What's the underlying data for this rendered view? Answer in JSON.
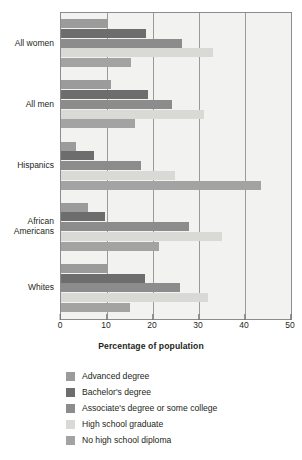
{
  "chart_data": {
    "type": "bar",
    "orientation": "horizontal",
    "title": "",
    "xlabel": "Percentage of population",
    "ylabel": "",
    "xlim": [
      0,
      50
    ],
    "xticks": [
      0,
      10,
      20,
      30,
      40,
      50
    ],
    "xtick_labels": [
      "0",
      "10",
      "20",
      "30",
      "40",
      "50"
    ],
    "grid": true,
    "grid_axis": "x",
    "legend_position": "bottom",
    "categories": [
      "All women",
      "All men",
      "Hispanics",
      "African\nAmericans",
      "Whites"
    ],
    "series": [
      {
        "name": "Advanced degree",
        "color": "#9b9b9b",
        "values": [
          10.0,
          10.9,
          3.3,
          5.8,
          10.0
        ]
      },
      {
        "name": "Bachelor's degree",
        "color": "#6d6d6d",
        "values": [
          18.5,
          19.0,
          7.2,
          9.6,
          18.2
        ]
      },
      {
        "name": "Associate's degree or some college",
        "color": "#8c8c8c",
        "values": [
          26.3,
          24.2,
          17.4,
          27.8,
          25.9
        ]
      },
      {
        "name": "High school graduate",
        "color": "#d9d9d6",
        "values": [
          33.0,
          31.0,
          24.8,
          35.0,
          32.0
        ]
      },
      {
        "name": "No high school diploma",
        "color": "#a3a3a3",
        "values": [
          15.2,
          16.0,
          43.5,
          21.2,
          15.0
        ]
      }
    ]
  },
  "legend": {
    "items": [
      {
        "label": "Advanced degree",
        "color": "#9b9b9b"
      },
      {
        "label": "Bachelor's degree",
        "color": "#6d6d6d"
      },
      {
        "label": "Associate's degree or some college",
        "color": "#8c8c8c"
      },
      {
        "label": "High school graduate",
        "color": "#d9d9d6"
      },
      {
        "label": "No high school diploma",
        "color": "#a3a3a3"
      }
    ]
  },
  "colors": {
    "plot_background": "#f2f2f0",
    "plot_border": "#8c8c8c",
    "gridline": "#9a9a9a",
    "text": "#231f20",
    "page_background": "#ffffff"
  }
}
